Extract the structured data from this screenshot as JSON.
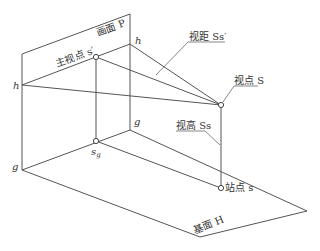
{
  "diagram": {
    "colors": {
      "line": "#555555",
      "text": "#333333",
      "background": "#ffffff"
    },
    "labels": {
      "picture_plane": "画面 P",
      "principal_point": "主视点 s′",
      "viewing_distance": "视距 Ss′",
      "viewpoint": "视点 S",
      "viewing_height": "视高 Ss",
      "station_point": "站点 s",
      "ground_plane": "基面 H",
      "horizon_left": "h",
      "horizon_right": "h",
      "ground_left": "g",
      "ground_right": "g",
      "principal_foot": "s",
      "principal_foot_sub": "g"
    },
    "points": {
      "picture_top_left": [
        22,
        54
      ],
      "picture_top_right": [
        130,
        14
      ],
      "horizon_left": [
        22,
        85
      ],
      "horizon_right": [
        130,
        44
      ],
      "principal_point": [
        96,
        57
      ],
      "principal_foot": [
        96,
        141
      ],
      "ground_left": [
        22,
        170
      ],
      "ground_back": [
        130,
        130
      ],
      "viewpoint": [
        221,
        105
      ],
      "station_point": [
        221,
        188
      ],
      "ground_right_corner": [
        307,
        211
      ],
      "ground_front_corner": [
        200,
        237
      ]
    }
  }
}
